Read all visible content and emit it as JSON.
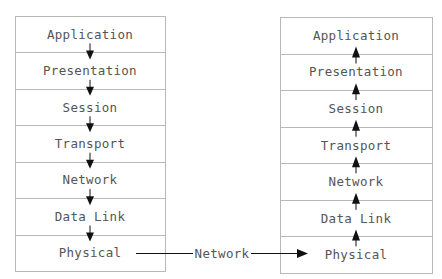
{
  "diagram": {
    "type": "osi-model-data-flow",
    "sender_stack": {
      "flow_direction": "down",
      "layers": [
        "Application",
        "Presentation",
        "Session",
        "Transport",
        "Network",
        "Data Link",
        "Physical"
      ]
    },
    "receiver_stack": {
      "flow_direction": "up",
      "layers": [
        "Application",
        "Presentation",
        "Session",
        "Transport",
        "Network",
        "Data Link",
        "Physical"
      ]
    },
    "connector": {
      "label": "Network",
      "from": "sender Physical",
      "to": "receiver Physical"
    }
  }
}
